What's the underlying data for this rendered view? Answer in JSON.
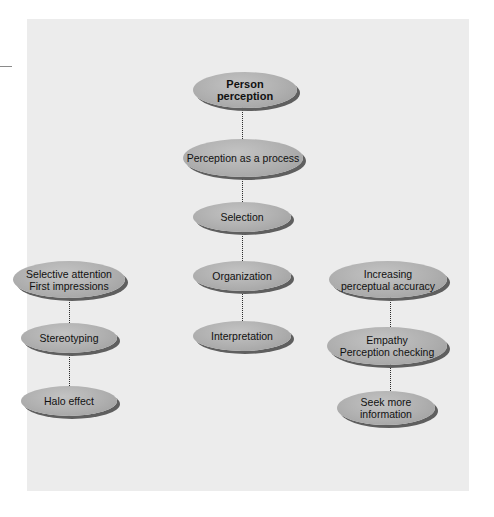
{
  "diagram": {
    "root": {
      "label_line1": "Person",
      "label_line2": "perception"
    },
    "process": {
      "label": "Perception as a process"
    },
    "stages": [
      {
        "label": "Selection"
      },
      {
        "label": "Organization"
      },
      {
        "label": "Interpretation"
      }
    ],
    "left_branch": [
      {
        "label_line1": "Selective attention",
        "label_line2": "First impressions"
      },
      {
        "label": "Stereotyping"
      },
      {
        "label": "Halo effect"
      }
    ],
    "right_branch": [
      {
        "label_line1": "Increasing",
        "label_line2": "perceptual accuracy"
      },
      {
        "label_line1": "Empathy",
        "label_line2": "Perception checking"
      },
      {
        "label_line1": "Seek more",
        "label_line2": "information"
      }
    ]
  },
  "colors": {
    "panel_background": "#ececec",
    "node_fill": "#afafaf",
    "node_shadow": "#5f5f5f",
    "connector": "#2b2b2b"
  }
}
